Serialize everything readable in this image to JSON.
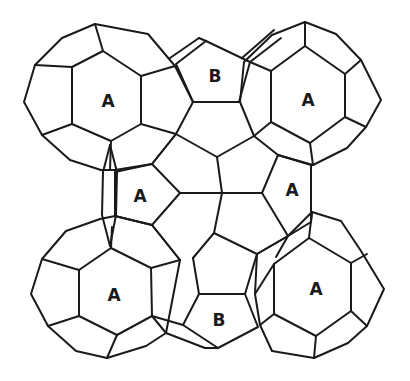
{
  "figure": {
    "stroke_color": "#1a1a1a",
    "background_color": "#ffffff"
  },
  "labels": [
    {
      "id": "top-left",
      "text": "A",
      "x": 108,
      "y": 101
    },
    {
      "id": "top-center",
      "text": "B",
      "x": 215,
      "y": 76
    },
    {
      "id": "top-right",
      "text": "A",
      "x": 308,
      "y": 100
    },
    {
      "id": "mid-left",
      "text": "A",
      "x": 140,
      "y": 196
    },
    {
      "id": "mid-right",
      "text": "A",
      "x": 292,
      "y": 190
    },
    {
      "id": "bottom-left",
      "text": "A",
      "x": 114,
      "y": 295
    },
    {
      "id": "bottom-center",
      "text": "B",
      "x": 219,
      "y": 320
    },
    {
      "id": "bottom-right",
      "text": "A",
      "x": 316,
      "y": 289
    }
  ]
}
